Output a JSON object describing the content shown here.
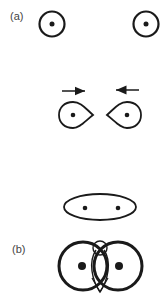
{
  "figure": {
    "panels": [
      {
        "id": "a",
        "label": "(a)",
        "description": "Two separated circles with central dots; approaching deformed teardrops with arrows; merged ellipse with two dots"
      },
      {
        "id": "b",
        "label": "(b)",
        "description": "Two overlapping thick circles with dots, with a small loop at the top crossing"
      }
    ],
    "colors": {
      "stroke": "#1a1a1a",
      "background": "#ffffff",
      "label": "#444444"
    }
  }
}
